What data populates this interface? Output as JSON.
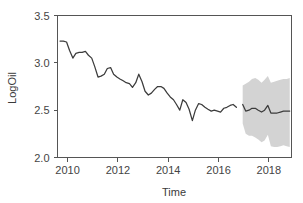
{
  "chart_data": {
    "type": "line",
    "title": "",
    "subtitle": "",
    "xlabel": "Time",
    "ylabel": "LogOil",
    "xlim": [
      2009.6,
      2018.9
    ],
    "ylim": [
      2.0,
      3.5
    ],
    "xticks": [
      2010,
      2012,
      2014,
      2016,
      2018
    ],
    "xtick_labels": [
      "2010",
      "2012",
      "2014",
      "2016",
      "2018"
    ],
    "yticks": [
      2.0,
      2.5,
      3.0,
      3.5
    ],
    "ytick_labels": [
      "2.0",
      "2.5",
      "3.0",
      "3.5"
    ],
    "grid": false,
    "legend": false,
    "legend_position": "none",
    "colors": {
      "line": "#3c3c3c",
      "band": "#d3d3d3",
      "axis": "#555555",
      "background": "#ffffff",
      "text": "#3a3a3a"
    },
    "series": [
      {
        "name": "Observed LogOil",
        "kind": "line",
        "x": [
          2009.7,
          2009.83,
          2009.96,
          2010.08,
          2010.21,
          2010.33,
          2010.46,
          2010.58,
          2010.71,
          2010.83,
          2010.96,
          2011.08,
          2011.21,
          2011.33,
          2011.46,
          2011.58,
          2011.71,
          2011.83,
          2011.96,
          2012.08,
          2012.21,
          2012.33,
          2012.46,
          2012.58,
          2012.71,
          2012.83,
          2012.96,
          2013.08,
          2013.21,
          2013.33,
          2013.46,
          2013.58,
          2013.71,
          2013.83,
          2013.96,
          2014.08,
          2014.21,
          2014.33,
          2014.46,
          2014.58,
          2014.71,
          2014.83,
          2014.96,
          2015.08,
          2015.21,
          2015.33,
          2015.46,
          2015.58,
          2015.71,
          2015.83,
          2015.96,
          2016.08,
          2016.21,
          2016.33,
          2016.46,
          2016.58,
          2016.71
        ],
        "y": [
          3.23,
          3.23,
          3.22,
          3.13,
          3.05,
          3.1,
          3.11,
          3.11,
          3.12,
          3.08,
          3.05,
          2.96,
          2.85,
          2.86,
          2.88,
          2.94,
          2.95,
          2.88,
          2.85,
          2.83,
          2.81,
          2.79,
          2.78,
          2.74,
          2.79,
          2.88,
          2.8,
          2.7,
          2.66,
          2.68,
          2.72,
          2.75,
          2.75,
          2.73,
          2.68,
          2.64,
          2.61,
          2.56,
          2.5,
          2.61,
          2.58,
          2.51,
          2.39,
          2.5,
          2.57,
          2.56,
          2.53,
          2.51,
          2.49,
          2.5,
          2.49,
          2.48,
          2.52,
          2.53,
          2.55,
          2.56,
          2.53
        ]
      },
      {
        "name": "Forecast LogOil",
        "kind": "line",
        "x": [
          2016.96,
          2017.08,
          2017.21,
          2017.33,
          2017.46,
          2017.58,
          2017.71,
          2017.83,
          2017.96,
          2018.08,
          2018.21,
          2018.33,
          2018.46,
          2018.58,
          2018.71,
          2018.83
        ],
        "y": [
          2.56,
          2.49,
          2.5,
          2.52,
          2.52,
          2.5,
          2.48,
          2.5,
          2.55,
          2.47,
          2.47,
          2.47,
          2.48,
          2.49,
          2.49,
          2.49
        ]
      }
    ],
    "confidence_band": {
      "name": "Forecast interval",
      "color": "#d3d3d3",
      "x": [
        2016.96,
        2017.08,
        2017.21,
        2017.33,
        2017.46,
        2017.58,
        2017.71,
        2017.83,
        2017.96,
        2018.08,
        2018.21,
        2018.33,
        2018.46,
        2018.58,
        2018.71,
        2018.83
      ],
      "upper": [
        2.76,
        2.78,
        2.8,
        2.83,
        2.84,
        2.82,
        2.79,
        2.82,
        2.86,
        2.79,
        2.8,
        2.81,
        2.82,
        2.83,
        2.83,
        2.84
      ],
      "lower": [
        2.36,
        2.25,
        2.23,
        2.23,
        2.21,
        2.19,
        2.16,
        2.18,
        2.24,
        2.12,
        2.11,
        2.11,
        2.12,
        2.13,
        2.12,
        2.11
      ]
    },
    "annotations": []
  },
  "axes": {
    "y_axis_title": "LogOil",
    "x_axis_title": "Time"
  }
}
